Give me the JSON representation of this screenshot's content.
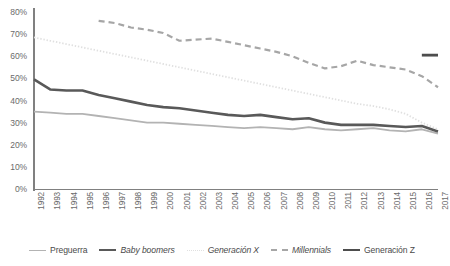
{
  "chart_data": {
    "type": "line",
    "title": "",
    "xlabel": "",
    "ylabel": "",
    "ylim": [
      0,
      80
    ],
    "yticks": [
      "0%",
      "10%",
      "20%",
      "30%",
      "40%",
      "50%",
      "60%",
      "70%",
      "80%"
    ],
    "grid": false,
    "legend_position": "bottom",
    "categories": [
      "1992",
      "1993",
      "1994",
      "1995",
      "1996",
      "1997",
      "1998",
      "1999",
      "2000",
      "2001",
      "2002",
      "2003",
      "2004",
      "2005",
      "2006",
      "2007",
      "2008",
      "2009",
      "2010",
      "2011",
      "2012",
      "2013",
      "2014",
      "2015",
      "2016",
      "2017"
    ],
    "series": [
      {
        "name": "Preguerra",
        "style": "solid",
        "color": "#b3b3b3",
        "width": 1.8,
        "values": [
          35,
          34.5,
          34,
          34,
          33,
          32,
          31,
          30,
          30,
          29.5,
          29,
          28.5,
          28,
          27.5,
          28,
          27.5,
          27,
          28,
          27,
          26.5,
          27,
          27.5,
          26.5,
          26,
          27,
          25
        ]
      },
      {
        "name": "Baby boomers",
        "style": "solid",
        "color": "#595959",
        "width": 2.6,
        "values": [
          49.5,
          45,
          44.5,
          44.5,
          42.5,
          41,
          39.5,
          38,
          37,
          36.5,
          35.5,
          34.5,
          33.5,
          33,
          33.5,
          32.5,
          31.5,
          32,
          30,
          29,
          29,
          29,
          28.5,
          28,
          28.5,
          26
        ]
      },
      {
        "name": "Generación X",
        "style": "dotted",
        "color": "#e0e0e0",
        "width": 1.8,
        "values": [
          68.5,
          67,
          65.5,
          64,
          62.5,
          61,
          59.5,
          58,
          56.5,
          55,
          53.5,
          52,
          50.5,
          49,
          47.5,
          46,
          44.5,
          43,
          41.5,
          40,
          38.5,
          37.5,
          36,
          34,
          30,
          27
        ]
      },
      {
        "name": "Millennials",
        "style": "dashed",
        "color": "#a6a6a6",
        "width": 2.2,
        "values": [
          null,
          null,
          null,
          null,
          76,
          75,
          73,
          72,
          70.5,
          67,
          67.5,
          68,
          66.5,
          65,
          63.5,
          62,
          60,
          57,
          54.5,
          55.5,
          58,
          56,
          55,
          54,
          51,
          46
        ]
      },
      {
        "name": "Generación Z",
        "style": "solid",
        "color": "#4d4d4d",
        "width": 2.8,
        "values": [
          null,
          null,
          null,
          null,
          null,
          null,
          null,
          null,
          null,
          null,
          null,
          null,
          null,
          null,
          null,
          null,
          null,
          null,
          null,
          null,
          null,
          null,
          null,
          null,
          60.5,
          60.5
        ]
      }
    ]
  },
  "legend": {
    "items": [
      {
        "label": "Preguerra",
        "italic": false
      },
      {
        "label": "Baby boomers",
        "italic": true
      },
      {
        "label": "Generación X",
        "italic": true
      },
      {
        "label": "Millennials",
        "italic": true
      },
      {
        "label": "Generación Z",
        "italic": false
      }
    ]
  }
}
